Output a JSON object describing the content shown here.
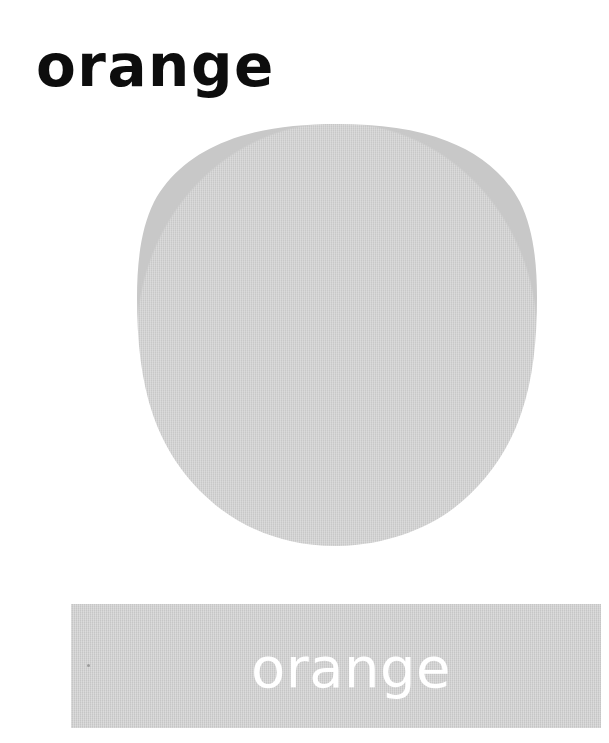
{
  "card": {
    "type": "vocabulary-flashcard",
    "background_color": "#ffffff",
    "width": 609,
    "height": 743
  },
  "top_label": {
    "text": "orange",
    "color": "#0d0d0d",
    "style": "bold-rounded-lowercase"
  },
  "illustration": {
    "name": "orange-fruit-circle",
    "shape": "circle",
    "fill_color": "#c8c8c8",
    "edge": "hand-cut-irregular",
    "texture": "woven-paper"
  },
  "color_band": {
    "label": "orange",
    "band_color": "#c6c6c6",
    "text_color": "#ffffff",
    "texture": "woven-paper"
  }
}
